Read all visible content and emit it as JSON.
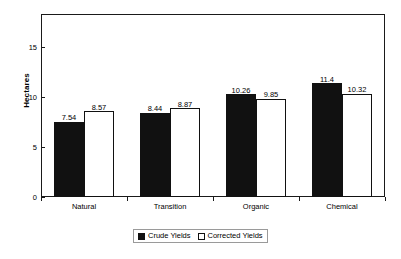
{
  "chart_data": {
    "type": "bar",
    "title": "",
    "subtitle": "",
    "xlabel": "",
    "ylabel": "Hectares",
    "categories": [
      "Natural",
      "Transition",
      "Organic",
      "Chemical"
    ],
    "series": [
      {
        "name": "Crude Yields",
        "color": "#111111",
        "fill": "solid",
        "values": [
          7.54,
          8.44,
          10.26,
          11.4
        ],
        "labels": [
          "7.54",
          "8.44",
          "10.26",
          "11.4"
        ]
      },
      {
        "name": "Corrected Yields",
        "color": "#ffffff",
        "fill": "hollow",
        "values": [
          8.57,
          8.87,
          9.85,
          10.32
        ],
        "labels": [
          "8.57",
          "8.87",
          "9.85",
          "10.32"
        ]
      }
    ],
    "ylim": [
      0,
      17.6
    ],
    "yticks": [
      0,
      5,
      10,
      15
    ],
    "ytick_labels": [
      "0",
      "5",
      "10",
      "15"
    ],
    "grid": false,
    "legend_position": "bottom-center",
    "data_labels": true,
    "frame": true
  },
  "axis": {
    "y_title": "Hectares",
    "ticks": [
      {
        "value": 15,
        "label": "15"
      },
      {
        "value": 10,
        "label": "10"
      },
      {
        "value": 5,
        "label": "5"
      },
      {
        "value": 0,
        "label": "0"
      }
    ]
  },
  "categories": [
    {
      "label": "Natural"
    },
    {
      "label": "Transition"
    },
    {
      "label": "Organic"
    },
    {
      "label": "Chemical"
    }
  ],
  "bars": [
    {
      "category": "Natural",
      "series": "Crude Yields",
      "value": 7.54,
      "label": "7.54"
    },
    {
      "category": "Natural",
      "series": "Corrected Yields",
      "value": 8.57,
      "label": "8.57"
    },
    {
      "category": "Transition",
      "series": "Crude Yields",
      "value": 8.44,
      "label": "8.44"
    },
    {
      "category": "Transition",
      "series": "Corrected Yields",
      "value": 8.87,
      "label": "8.87"
    },
    {
      "category": "Organic",
      "series": "Crude Yields",
      "value": 10.26,
      "label": "10.26"
    },
    {
      "category": "Organic",
      "series": "Corrected Yields",
      "value": 9.85,
      "label": "9.85"
    },
    {
      "category": "Chemical",
      "series": "Crude Yields",
      "value": 11.4,
      "label": "11.4"
    },
    {
      "category": "Chemical",
      "series": "Corrected Yields",
      "value": 10.32,
      "label": "10.32"
    }
  ],
  "legend": {
    "items": [
      {
        "label": "Crude Yields",
        "swatch": "filled-square-icon"
      },
      {
        "label": "Corrected Yields",
        "swatch": "hollow-square-icon"
      }
    ]
  }
}
